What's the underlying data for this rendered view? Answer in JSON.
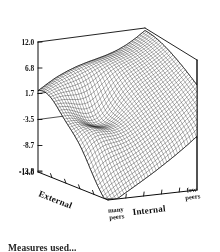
{
  "figure": {
    "background": "#ffffff",
    "ink_color": "#111111"
  },
  "caption": {
    "text": "Measures used..."
  },
  "chart_data": {
    "type": "surface",
    "title": "",
    "xlabel": "External",
    "ylabel": "Internal",
    "zlabel": "",
    "grid": false,
    "legend": "none",
    "zlim": [
      -14.0,
      12.0
    ],
    "z_ticks": [
      12.0,
      6.8,
      1.7,
      -3.5,
      -8.7,
      -13.8,
      -14.0
    ],
    "z_tick_labels": [
      "12.0",
      "6.8",
      "1.7",
      "-3.5",
      "-8.7",
      "-13.8",
      "-14.0"
    ],
    "x_axis": {
      "name": "External",
      "tick_labels": [
        "many peers"
      ],
      "tick_count": 4
    },
    "y_axis": {
      "name": "Internal",
      "tick_labels": [
        "few peers"
      ],
      "tick_count": 4
    },
    "mesh": {
      "nx": 40,
      "ny": 40,
      "description": "dense wireframe response surface, saddle-shaped with a high ridge at the far corner and a depression near the front-left"
    },
    "surface_notes": "Response surface rising steeply toward the back corner (high External / few Internal peers) and falling toward the front-right corner.",
    "peak_value": 12.0,
    "trough_value": -14.0
  },
  "axis_labels": {
    "external": "External",
    "internal": "Internal",
    "many_peers_line1": "many",
    "many_peers_line2": "peers",
    "few_peers_line1": "few",
    "few_peers_line2": "peers"
  }
}
